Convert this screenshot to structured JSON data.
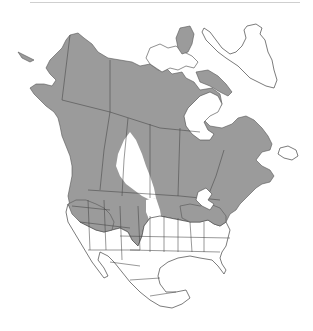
{
  "map": {
    "title": "",
    "region": "North America",
    "type": "species range map",
    "colors": {
      "range_fill": "#9b9b9b",
      "land_fill": "#ffffff",
      "boundary_stroke": "#444444",
      "divider": "#cfcfcf"
    },
    "legend": []
  }
}
